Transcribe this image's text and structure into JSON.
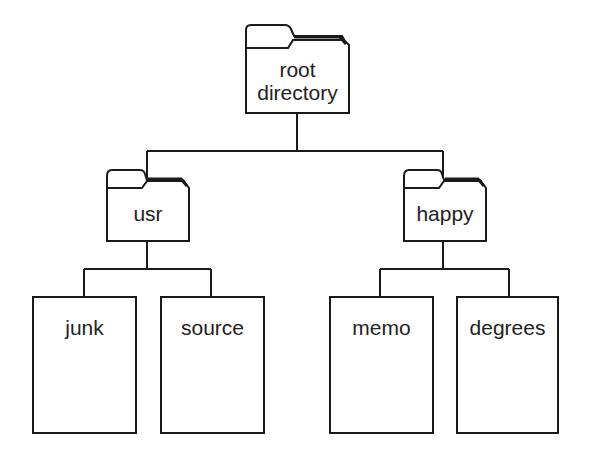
{
  "diagram": {
    "type": "directory-tree",
    "root": {
      "label_line1": "root",
      "label_line2": "directory",
      "kind": "folder"
    },
    "directories": [
      {
        "label": "usr",
        "kind": "folder",
        "children": [
          {
            "label": "junk",
            "kind": "file"
          },
          {
            "label": "source",
            "kind": "file"
          }
        ]
      },
      {
        "label": "happy",
        "kind": "folder",
        "children": [
          {
            "label": "memo",
            "kind": "file"
          },
          {
            "label": "degrees",
            "kind": "file"
          }
        ]
      }
    ],
    "colors": {
      "stroke": "#1a1a1a",
      "background": "#ffffff",
      "text": "#222222"
    }
  }
}
